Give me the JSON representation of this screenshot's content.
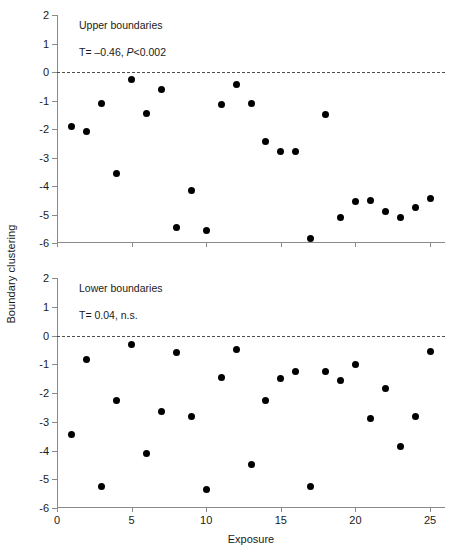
{
  "figure": {
    "ylabel": "Boundary clustering",
    "xlabel": "Exposure",
    "marker_color": "#000000",
    "axis_color": "#8a8a8a",
    "zeroline_color": "#4d4d4d"
  },
  "axes": {
    "y_ticks": [
      "2",
      "1",
      "0",
      "-1",
      "-2",
      "-3",
      "-4",
      "-5",
      "-6"
    ],
    "x_ticks": [
      "0",
      "5",
      "10",
      "15",
      "20",
      "25"
    ]
  },
  "panels": [
    {
      "title": "Upper boundaries",
      "stat_prefix": "T",
      "stat_text": "= –0.46, ",
      "stat_italic": "P",
      "stat_suffix": "<0.002"
    },
    {
      "title": "Lower boundaries",
      "stat_prefix": "T",
      "stat_text": "= 0.04, n.s.",
      "stat_italic": "",
      "stat_suffix": ""
    }
  ],
  "chart_data": [
    {
      "type": "scatter",
      "title": "Upper boundaries",
      "xlabel": "Exposure",
      "ylabel": "Boundary clustering",
      "xlim": [
        0,
        26
      ],
      "ylim": [
        -6,
        2
      ],
      "xticks": [
        0,
        5,
        10,
        15,
        20,
        25
      ],
      "yticks": [
        2,
        1,
        0,
        -1,
        -2,
        -3,
        -4,
        -5,
        -6
      ],
      "grid": false,
      "legend": null,
      "reference_lines": [
        {
          "y": 0,
          "style": "dashed"
        }
      ],
      "annotations": [
        "Upper boundaries",
        "T= –0.46, P<0.002"
      ],
      "statistics": {
        "tau": -0.46,
        "p_text": "P<0.002",
        "significant": true
      },
      "x": [
        1,
        2,
        3,
        4,
        5,
        6,
        7,
        8,
        9,
        10,
        11,
        12,
        13,
        14,
        15,
        16,
        17,
        18,
        19,
        20,
        21,
        22,
        23,
        24,
        25
      ],
      "y": [
        -1.9,
        -2.1,
        -1.1,
        -3.55,
        -0.25,
        -1.45,
        -0.6,
        -5.45,
        -4.15,
        -5.55,
        -1.15,
        -0.45,
        -1.1,
        -2.45,
        -2.8,
        -2.8,
        -5.85,
        -1.5,
        -5.1,
        -4.55,
        -4.5,
        -4.9,
        -5.1,
        -4.75,
        -4.45
      ]
    },
    {
      "type": "scatter",
      "title": "Lower boundaries",
      "xlabel": "Exposure",
      "ylabel": "Boundary clustering",
      "xlim": [
        0,
        26
      ],
      "ylim": [
        -6,
        2
      ],
      "xticks": [
        0,
        5,
        10,
        15,
        20,
        25
      ],
      "yticks": [
        2,
        1,
        0,
        -1,
        -2,
        -3,
        -4,
        -5,
        -6
      ],
      "grid": false,
      "legend": null,
      "reference_lines": [
        {
          "y": 0,
          "style": "dashed"
        }
      ],
      "annotations": [
        "Lower boundaries",
        "T= 0.04, n.s."
      ],
      "statistics": {
        "tau": 0.04,
        "p_text": "n.s.",
        "significant": false
      },
      "x": [
        1,
        2,
        3,
        4,
        5,
        6,
        7,
        8,
        9,
        10,
        11,
        12,
        13,
        14,
        15,
        16,
        17,
        18,
        19,
        20,
        21,
        22,
        23,
        24,
        25
      ],
      "y": [
        -3.45,
        -0.85,
        -5.25,
        -2.25,
        -0.3,
        -4.1,
        -2.65,
        -0.6,
        -2.8,
        -5.35,
        -1.45,
        -0.5,
        -4.5,
        -2.25,
        -1.5,
        -1.25,
        -5.25,
        -1.25,
        -1.55,
        -1.0,
        -2.9,
        -1.85,
        -3.85,
        -2.8,
        -0.55
      ]
    }
  ]
}
